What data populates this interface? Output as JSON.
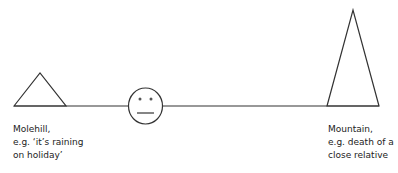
{
  "diagram": {
    "left": {
      "name": "Molehill,",
      "line2": "e.g. ‘it’s raining",
      "line3": "on holiday’"
    },
    "right": {
      "name": "Mountain,",
      "line2": "e.g. death of a",
      "line3": "close relative"
    },
    "colors": {
      "stroke": "#333333"
    }
  }
}
